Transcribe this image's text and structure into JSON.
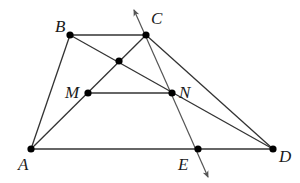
{
  "diagram": {
    "points": [
      {
        "id": "B",
        "label": "B"
      },
      {
        "id": "C",
        "label": "C"
      },
      {
        "id": "O",
        "label": ""
      },
      {
        "id": "M",
        "label": "M"
      },
      {
        "id": "N",
        "label": "N"
      },
      {
        "id": "A",
        "label": "A"
      },
      {
        "id": "E",
        "label": "E"
      },
      {
        "id": "D",
        "label": "D"
      }
    ],
    "segments": [
      "AB",
      "BC",
      "AD",
      "CD",
      "AC",
      "BD",
      "MN"
    ],
    "arrow_line": {
      "through": [
        "C",
        "N",
        "E"
      ],
      "both_ends_arrowed": true
    }
  },
  "colors": {
    "line": "#333333",
    "point": "#000000",
    "background": "#ffffff"
  }
}
